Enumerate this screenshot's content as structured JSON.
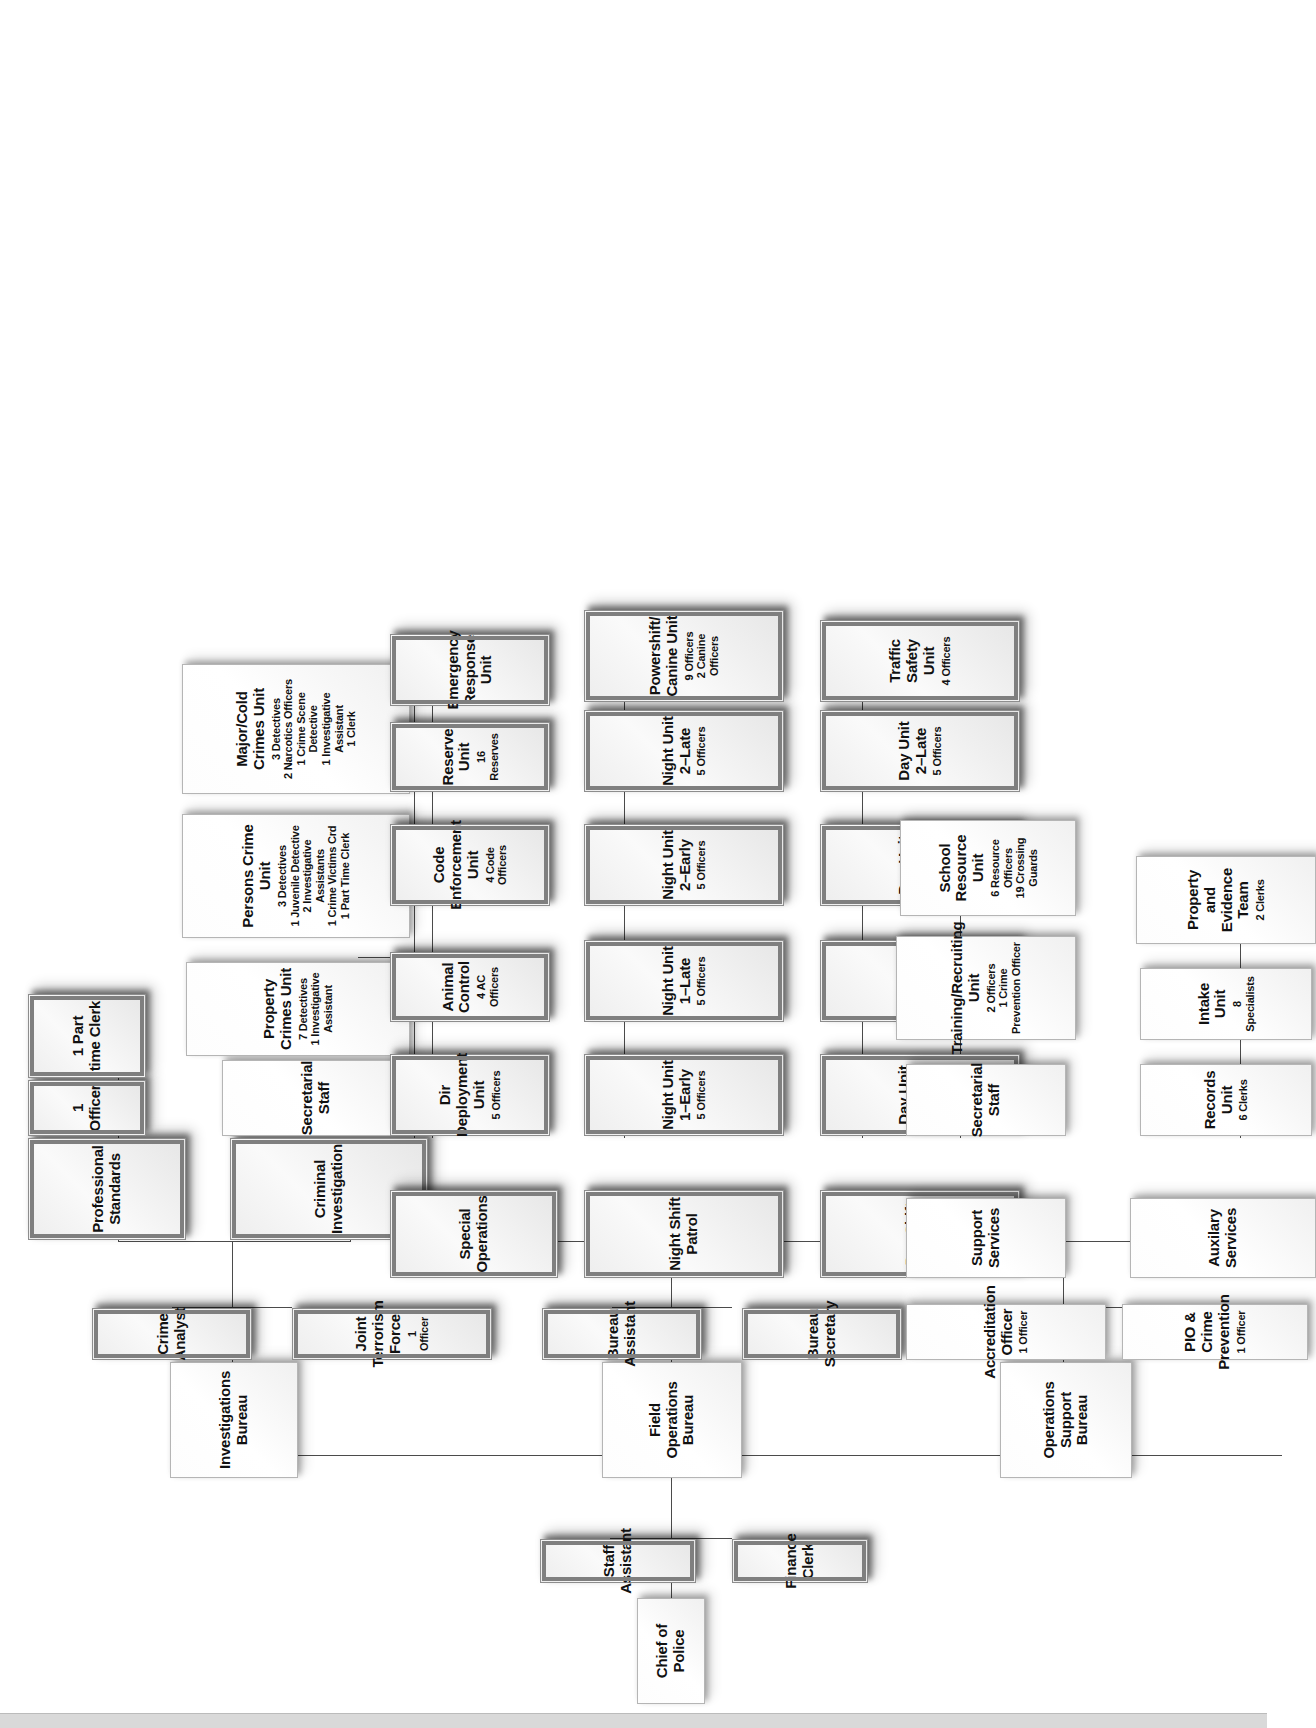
{
  "chart": {
    "type": "org-chart",
    "orientation": "rotated-90-ccw",
    "root": "Chief of Police",
    "nodes": {
      "chief": {
        "title": "Chief of Police",
        "sub": ""
      },
      "staff_assistant": {
        "title": "Staff Assistant",
        "sub": ""
      },
      "finance_clerk": {
        "title": "Finance Clerk",
        "sub": ""
      },
      "investigations_bureau": {
        "title": "Investigations Bureau",
        "sub": ""
      },
      "crime_analyst": {
        "title": "Crime Analyst",
        "sub": ""
      },
      "joint_terrorism_force": {
        "title": "Joint Terrorism Force",
        "sub": "1 Officer"
      },
      "professional_standards": {
        "title": "Professional Standards",
        "sub": ""
      },
      "ps_officer": {
        "title": "1 Officer",
        "sub": ""
      },
      "ps_part_time_clerk": {
        "title": "1 Part time Clerk",
        "sub": ""
      },
      "criminal_investigation": {
        "title": "Criminal Investigation",
        "sub": ""
      },
      "ci_secretarial_staff": {
        "title": "Secretarial Staff",
        "sub": ""
      },
      "property_crimes_unit": {
        "title": "Property Crimes Unit",
        "sub": "7 Detectives\n1 Investigative Assistant"
      },
      "persons_crime_unit": {
        "title": "Persons Crime Unit",
        "sub": "3 Detectives\n1 Juvenile Detective\n2 Investigative Assistants\n1 Crime Victims Crd\n1 Part Time Clerk"
      },
      "major_cold_crimes_unit": {
        "title": "Major/Cold Crimes Unit",
        "sub": "3 Detectives\n2 Narcotics Officers\n1 Crime Scene Detective\n1 Investigative Assistant\n1 Clerk"
      },
      "field_operations_bureau": {
        "title": "Field Operations Bureau",
        "sub": ""
      },
      "bureau_assistant": {
        "title": "Bureau Assistant",
        "sub": ""
      },
      "bureau_secretary": {
        "title": "Bureau Secretary",
        "sub": ""
      },
      "special_operations": {
        "title": "Special Operations",
        "sub": ""
      },
      "dir_deployment_unit": {
        "title": "Dir Deployment Unit",
        "sub": "5 Officers"
      },
      "animal_control": {
        "title": "Animal Control",
        "sub": "4 AC Officers"
      },
      "code_enforcement_unit": {
        "title": "Code Enforcement Unit",
        "sub": "4 Code Officers"
      },
      "reserve_unit": {
        "title": "Reserve Unit",
        "sub": "16 Reserves"
      },
      "emergency_response_unit": {
        "title": "Emergency Response Unit",
        "sub": ""
      },
      "night_shift_patrol": {
        "title": "Night Shift Patrol",
        "sub": ""
      },
      "night_unit_1_early": {
        "title": "Night Unit 1–Early",
        "sub": "5 Officers"
      },
      "night_unit_1_late": {
        "title": "Night Unit 1–Late",
        "sub": "5 Officers"
      },
      "night_unit_2_early": {
        "title": "Night Unit 2–Early",
        "sub": "5 Officers"
      },
      "night_unit_2_late": {
        "title": "Night Unit 2–Late",
        "sub": "5 Officers"
      },
      "powershift_canine_unit": {
        "title": "Powershift/ Canine Unit",
        "sub": "9 Officers\n2 Canine Officers"
      },
      "day_shift_patrol": {
        "title": "Day Shift Patrol",
        "sub": ""
      },
      "day_unit_1_early": {
        "title": "Day Unit 1–Early",
        "sub": "5 Officers"
      },
      "day_unit_1_late": {
        "title": "Day Unit 1–Late",
        "sub": "5 Officers"
      },
      "day_unit_2_early": {
        "title": "Day Unit 2–Early",
        "sub": "5 Officers"
      },
      "day_unit_2_late": {
        "title": "Day Unit 2–Late",
        "sub": "5 Officers"
      },
      "traffic_safety_unit": {
        "title": "Traffic Safety Unit",
        "sub": "4 Officers"
      },
      "operations_support_bureau": {
        "title": "Operations Support Bureau",
        "sub": ""
      },
      "accreditation_officer": {
        "title": "Accreditation Officer",
        "sub": "1 Officer"
      },
      "pio_crime_prevention": {
        "title": "PIO & Crime Prevention",
        "sub": "1 Officer"
      },
      "support_services": {
        "title": "Support Services",
        "sub": ""
      },
      "ss_secretarial_staff": {
        "title": "Secretarial Staff",
        "sub": ""
      },
      "training_recruiting_unit": {
        "title": "Training/Recruiting Unit",
        "sub": "2 Officers\n1 Crime Prevention Officer"
      },
      "school_resource_unit": {
        "title": "School Resource Unit",
        "sub": "6 Resource Officers\n19 Crossing Guards"
      },
      "auxilary_services": {
        "title": "Auxilary Services",
        "sub": ""
      },
      "records_unit": {
        "title": "Records Unit",
        "sub": "6 Clerks"
      },
      "intake_unit": {
        "title": "Intake Unit",
        "sub": "8 Specialists"
      },
      "property_evidence_team": {
        "title": "Property and Evidence Team",
        "sub": "2 Clerks"
      }
    }
  }
}
